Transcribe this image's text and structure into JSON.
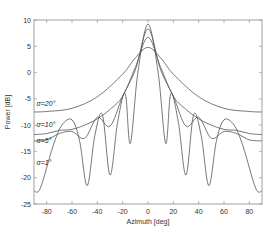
{
  "chart_data": {
    "type": "line",
    "title": "",
    "xlabel": "Azimuth [deg]",
    "ylabel": "Power [dB]",
    "xlim": [
      -90,
      90
    ],
    "ylim": [
      -25,
      10
    ],
    "xticks": [
      -80,
      -60,
      -40,
      -20,
      0,
      20,
      40,
      60,
      80
    ],
    "yticks": [
      10,
      5,
      0,
      -5,
      -10,
      -15,
      -20,
      -25
    ],
    "grid": false,
    "legend": "inline annotations",
    "series": [
      {
        "name": "σ=20°",
        "x": [
          -90,
          -80,
          -60,
          -40,
          -20,
          -10,
          0,
          10,
          20,
          40,
          60,
          80,
          90
        ],
        "y": [
          -7.5,
          -7.4,
          -6.8,
          -4.6,
          -0.3,
          2.8,
          4.8,
          2.8,
          -0.3,
          -4.6,
          -6.8,
          -7.4,
          -7.5
        ]
      },
      {
        "name": "σ=10°",
        "x": [
          -90,
          -80,
          -70,
          -60,
          -50,
          -40,
          -30,
          -20,
          -10,
          0,
          10,
          20,
          30,
          40,
          50,
          60,
          70,
          80,
          90
        ],
        "y": [
          -11.8,
          -11.6,
          -11.0,
          -10.8,
          -10.0,
          -8.8,
          -7.0,
          -4.5,
          1.0,
          6.7,
          1.0,
          -4.5,
          -7.0,
          -8.8,
          -10.0,
          -10.8,
          -11.0,
          -11.6,
          -11.8
        ]
      },
      {
        "name": "σ=5°",
        "x": [
          -90,
          -80,
          -70,
          -60,
          -50,
          -40,
          -30,
          -20,
          -10,
          0,
          10,
          20,
          30,
          40,
          50,
          60,
          70,
          80,
          90
        ],
        "y": [
          -13.0,
          -12.8,
          -11.6,
          -11.2,
          -12.5,
          -8.5,
          -10.2,
          -4.5,
          0.5,
          8.3,
          0.5,
          -4.5,
          -10.2,
          -8.5,
          -12.5,
          -11.2,
          -11.6,
          -12.8,
          -13.0
        ]
      },
      {
        "name": "σ=1°",
        "x": [
          -90,
          -85,
          -75,
          -68,
          -60,
          -54,
          -48,
          -42,
          -36,
          -30,
          -24,
          -18,
          -14,
          -8,
          0,
          8,
          14,
          18,
          24,
          30,
          36,
          42,
          48,
          54,
          60,
          68,
          75,
          85,
          90
        ],
        "y": [
          -22.5,
          -22.0,
          -14.0,
          -10.0,
          -9.0,
          -13.0,
          -21.5,
          -12.0,
          -8.0,
          -19.5,
          -9.5,
          -4.0,
          -13.5,
          0.0,
          9.2,
          0.0,
          -13.5,
          -4.0,
          -9.5,
          -19.5,
          -8.0,
          -12.0,
          -21.5,
          -13.0,
          -9.0,
          -10.0,
          -14.0,
          -22.0,
          -22.5
        ]
      }
    ],
    "annotations": [
      {
        "text": "σ=20°",
        "x": -88,
        "y": -6.3
      },
      {
        "text": "σ=10°",
        "x": -88,
        "y": -10.3
      },
      {
        "text": "σ=5°",
        "x": -88,
        "y": -13.4
      },
      {
        "text": "σ=1°",
        "x": -88,
        "y": -17.5
      }
    ],
    "line_color": "#555555"
  }
}
